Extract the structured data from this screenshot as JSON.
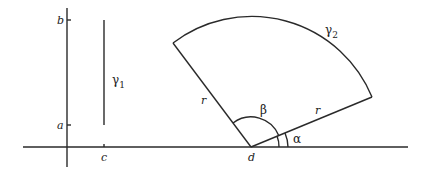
{
  "figure": {
    "left_panel": {
      "axis_labels": {
        "a": "a",
        "b": "b",
        "c": "c"
      },
      "curve_label": {
        "symbol": "γ",
        "subscript": "1"
      }
    },
    "right_panel": {
      "vertex_label": "d",
      "radius_label_left": "r",
      "radius_label_right": "r",
      "angle_alpha": "α",
      "angle_beta": "β",
      "curve_label": {
        "symbol": "γ",
        "subscript": "2"
      }
    }
  }
}
